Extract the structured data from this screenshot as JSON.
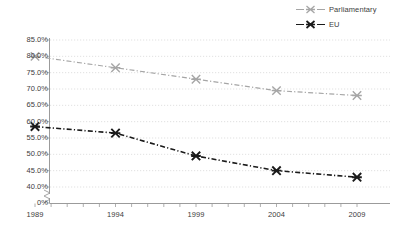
{
  "chart_data": {
    "type": "line",
    "title": "",
    "subtitle": "",
    "xlabel": "",
    "ylabel": "",
    "x": [
      1989,
      1994,
      1999,
      2004,
      2009
    ],
    "categories": [
      "1989",
      "1994",
      "1999",
      "2004",
      "2009"
    ],
    "series": [
      {
        "name": "Parliamentary",
        "color": "#a6a6a6",
        "marker": "x-cross",
        "linestyle": "dash-dot",
        "values": [
          80.0,
          76.5,
          73.0,
          69.5,
          68.0
        ]
      },
      {
        "name": "EU",
        "color": "#1a1a1a",
        "marker": "x-cross",
        "linestyle": "dash-dot",
        "values": [
          58.5,
          56.5,
          49.5,
          45.0,
          43.0
        ]
      }
    ],
    "ylim": [
      40.0,
      85.0
    ],
    "ytick_labels": [
      "85.0%",
      "80.0%",
      "75.0%",
      "70.0%",
      "65.0%",
      "60.0%",
      "55.0%",
      "50.0%",
      "45.0%",
      "40.0%",
      "0%"
    ],
    "ytick_values": [
      85.0,
      80.0,
      75.0,
      70.0,
      65.0,
      60.0,
      55.0,
      50.0,
      45.0,
      40.0,
      0
    ],
    "y_axis_break": true,
    "y_axis_break_label": "0%",
    "xlim": [
      1989,
      2009
    ],
    "xtick_labels": [
      "1989",
      "1994",
      "1999",
      "2004",
      "2009"
    ],
    "x_minor_tick_interval": 1,
    "grid": "horizontal-dotted",
    "grid_color": "#d9d9d9",
    "legend_position": "top-right",
    "legend_entries": [
      "Parliamentary",
      "EU"
    ]
  },
  "legend": {
    "entries": [
      {
        "label": "Parliamentary",
        "color": "#a6a6a6"
      },
      {
        "label": "EU",
        "color": "#1a1a1a"
      }
    ]
  },
  "axes": {
    "y_labels": [
      "85.0%",
      "80.0%",
      "75.0%",
      "70.0%",
      "65.0%",
      "60.0%",
      "55.0%",
      "50.0%",
      "45.0%",
      "40.0%",
      "0%"
    ],
    "x_labels": [
      "1989",
      "1994",
      "1999",
      "2004",
      "2009"
    ]
  },
  "colors": {
    "parliamentary": "#a6a6a6",
    "eu": "#1a1a1a",
    "grid": "#d9d9d9",
    "axis": "#9b9b9b",
    "text": "#3d3d3d",
    "background": "#ffffff"
  }
}
